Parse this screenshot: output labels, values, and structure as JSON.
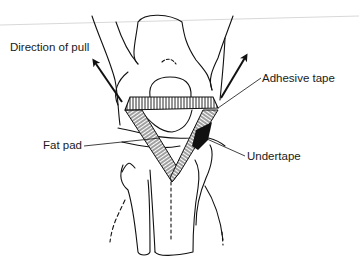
{
  "figure": {
    "type": "anatomical line drawing",
    "labels": {
      "direction_of_pull": "Direction of pull",
      "adhesive_tape": "Adhesive tape",
      "fat_pad": "Fat pad",
      "undertape": "Undertape"
    },
    "arrows": [
      {
        "name": "left-pull-arrow",
        "direction": "up-left"
      },
      {
        "name": "right-pull-arrow",
        "direction": "up-right"
      }
    ],
    "colors": {
      "ink": "#111111",
      "background": "#ffffff",
      "guide_line": "#d8d8d8"
    }
  }
}
